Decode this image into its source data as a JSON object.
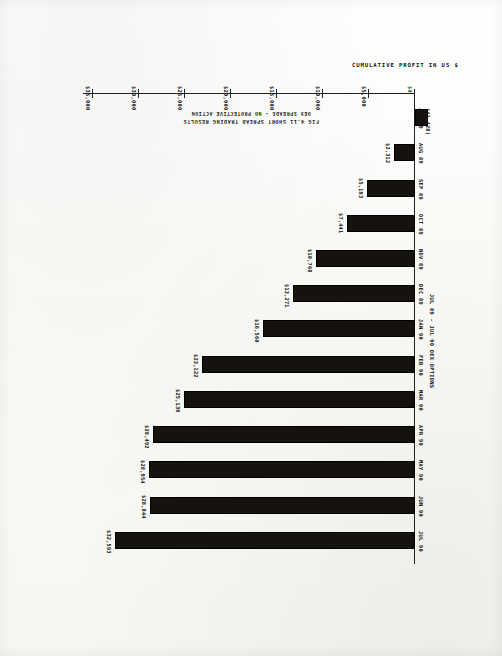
{
  "figure": {
    "title_line1": "FIG 4.11  SHORT SPREAD TRADING RESULTS",
    "title_line2": "OEX SPREADS - NO PROTECTIVE ACTION",
    "series_note": "JUL 89 - JUL 90 OEX OPTIONS"
  },
  "chart_data": {
    "type": "bar",
    "title": "FIG 4.11  SHORT SPREAD TRADING RESULTS",
    "subtitle": "OEX SPREADS - NO PROTECTIVE ACTION",
    "xlabel": "",
    "ylabel": "CUMULATIVE PROFIT IN US $",
    "orientation": "horizontal",
    "grid": false,
    "legend": "none",
    "ylim": [
      -1000,
      35000
    ],
    "axis_ticks": [
      "$0",
      "$5,000",
      "$10,000",
      "$15,000",
      "$20,000",
      "$25,000",
      "$30,000",
      "$35,000"
    ],
    "axis_tick_values": [
      0,
      5000,
      10000,
      15000,
      20000,
      25000,
      30000,
      35000
    ],
    "categories": [
      "JUL 89",
      "AUG 89",
      "SEP 89",
      "OCT 89",
      "NOV 89",
      "DEC 89",
      "JAN 90",
      "FEB 90",
      "MAR 90",
      "APR 90",
      "MAY 90",
      "JUN 90",
      "JUL 90"
    ],
    "values": [
      -1428,
      2312,
      5193,
      7441,
      10768,
      13271,
      16560,
      23122,
      25139,
      28492,
      28954,
      28844,
      32593
    ],
    "value_labels": [
      "($1,428)",
      "$2,312",
      "$5,193",
      "$7,441",
      "$10,768",
      "$13,271",
      "$16,560",
      "$23,122",
      "$25,139",
      "$28,492",
      "$28,954",
      "$28,844",
      "$32,593"
    ],
    "series_note": "JUL 89 - JUL 90 OEX OPTIONS",
    "bar_color": "#151210",
    "zero_label_color": "#1b5e20"
  }
}
